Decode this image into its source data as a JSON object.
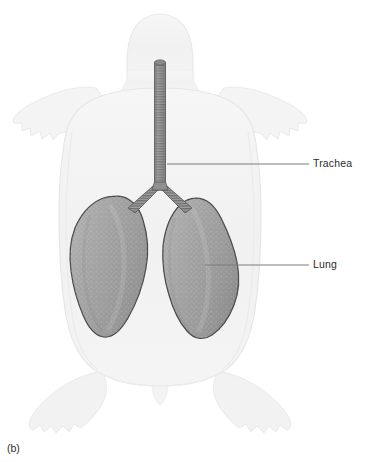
{
  "figure": {
    "panel_caption": "(b)",
    "view": "ventral-dorsal-outline"
  },
  "labels": [
    {
      "id": "trachea",
      "text": "Trachea",
      "leader_line": {
        "x1": 167,
        "y1": 164,
        "x2": 309,
        "y2": 164
      },
      "text_position": {
        "x": 313,
        "y": 158
      }
    },
    {
      "id": "lung",
      "text": "Lung",
      "leader_line": {
        "x1": 205,
        "y1": 265,
        "x2": 309,
        "y2": 265
      },
      "text_position": {
        "x": 313,
        "y": 259
      }
    }
  ],
  "structures": {
    "body_outline": {
      "name": "turtle-body-outline",
      "fill": "#f3f3f3",
      "stroke": "#e4e4e4"
    },
    "shell": {
      "name": "turtle-shell",
      "fill": "#fbfbfb",
      "stroke": "#ededed"
    },
    "trachea": {
      "name": "trachea",
      "fill": "#8d8d8d",
      "stroke": "#5c5c5c",
      "ring_count": 46
    },
    "bronchus_left": {
      "name": "left-bronchus",
      "fill": "#8d8d8d",
      "stroke": "#5c5c5c"
    },
    "bronchus_right": {
      "name": "right-bronchus",
      "fill": "#8d8d8d",
      "stroke": "#5c5c5c"
    },
    "lung_left": {
      "name": "left-lung",
      "fill": "#9d9d9d",
      "stroke": "#4a4a4a"
    },
    "lung_right": {
      "name": "right-lung",
      "fill": "#9d9d9d",
      "stroke": "#4a4a4a"
    }
  },
  "colors": {
    "background": "#ffffff",
    "label_text": "#2b2b2b",
    "leader_line": "#808080",
    "lung_fill": "#9d9d9d",
    "lung_outline": "#4a4a4a",
    "trachea_fill": "#8d8d8d",
    "body_pale": "#f3f3f3"
  }
}
